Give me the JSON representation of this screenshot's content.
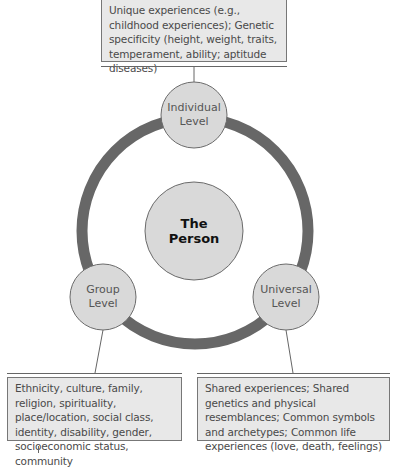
{
  "diagram": {
    "center": {
      "title_line1": "The",
      "title_line2": "Person"
    },
    "nodes": {
      "individual": {
        "line1": "Individual",
        "line2": "Level"
      },
      "group": {
        "line1": "Group",
        "line2": "Level"
      },
      "universal": {
        "line1": "Universal",
        "line2": "Level"
      }
    },
    "boxes": {
      "individual": "Unique experiences (e.g., childhood experiences); Genetic specificity (height, weight, traits, temperament, ability; aptitude diseases)",
      "group": "Ethnicity, culture, family, religion, spirituality, place/location, social class, identity, disability, gender, socioeconomic status, community",
      "universal": "Shared experiences; Shared genetics and physical resemblances; Common symbols and archetypes; Common life experiences (love, death, feelings)"
    },
    "colors": {
      "ring": "#666666",
      "node_fill": "#d9d9d9",
      "node_stroke": "#6b6b6b",
      "box_fill": "#e8e8e8",
      "box_border": "#777777",
      "connector": "#666666"
    }
  }
}
